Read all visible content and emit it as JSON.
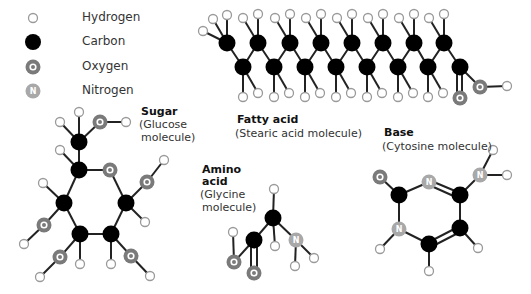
{
  "legend": [
    {
      "key": "hydrogen",
      "label": "Hydrogen",
      "symbol": ""
    },
    {
      "key": "carbon",
      "label": "Carbon",
      "symbol": ""
    },
    {
      "key": "oxygen",
      "label": "Oxygen",
      "symbol": "O"
    },
    {
      "key": "nitrogen",
      "label": "Nitrogen",
      "symbol": "N"
    }
  ],
  "colors": {
    "hydrogen_fill": "#ffffff",
    "hydrogen_stroke": "#9a9a9a",
    "carbon_fill": "#000000",
    "oxygen_fill": "#7a7a7a",
    "oxygen_inner": "#ffffff",
    "nitrogen_fill": "#a8a8a8",
    "bond": "#222222"
  },
  "molecules": {
    "sugar": {
      "title": "Sugar",
      "subtitle_line1": "(Glucose",
      "subtitle_line2": "molecule)"
    },
    "fatty_acid": {
      "title": "Fatty acid",
      "subtitle_line1": "(Stearic acid molecule)"
    },
    "amino_acid": {
      "title_line1": "Amino",
      "title_line2": "acid",
      "subtitle_line1": "(Glycine",
      "subtitle_line2": "molecule)"
    },
    "base": {
      "title": "Base",
      "subtitle_line1": "(Cytosine molecule)"
    }
  }
}
